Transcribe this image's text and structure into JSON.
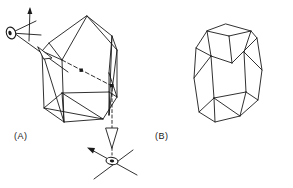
{
  "figure": {
    "background_color": "#ffffff",
    "line_color": "#1a1a1a",
    "panels": [
      {
        "id": "panel-a",
        "label": "(A)",
        "label_x": 14,
        "label_y": 131,
        "description": "Crystal prism with traced light ray and two viewing-direction eye symbols with crossed axes"
      },
      {
        "id": "panel-b",
        "label": "(B)",
        "label_x": 155,
        "label_y": 131,
        "description": "Bare polyhedral crystal outline, hexagonal prism with pyramidal terminations"
      }
    ],
    "panel_a": {
      "crystal_outline": [
        [
          87,
          16
        ],
        [
          112,
          36
        ],
        [
          115,
          43
        ],
        [
          117,
          97
        ],
        [
          103,
          119
        ],
        [
          64,
          122
        ],
        [
          44,
          108
        ],
        [
          42,
          51
        ],
        [
          49,
          43
        ],
        [
          87,
          16
        ]
      ],
      "crystal_edges": [
        {
          "name": "apex-to-left-front",
          "points": [
            [
              87,
              16
            ],
            [
              62,
              60
            ]
          ]
        },
        {
          "name": "apex-to-right-front",
          "points": [
            [
              87,
              16
            ],
            [
              112,
              36
            ]
          ]
        },
        {
          "name": "left-upper-face",
          "points": [
            [
              49,
              43
            ],
            [
              62,
              60
            ]
          ]
        },
        {
          "name": "right-upper-face",
          "points": [
            [
              112,
              36
            ],
            [
              109,
              73
            ]
          ]
        },
        {
          "name": "front-vertical",
          "points": [
            [
              62,
              60
            ],
            [
              64,
              122
            ]
          ]
        },
        {
          "name": "left-vertical",
          "points": [
            [
              42,
              51
            ],
            [
              44,
              108
            ]
          ]
        },
        {
          "name": "right-vertical",
          "points": [
            [
              109,
              73
            ],
            [
              109,
              115
            ]
          ]
        },
        {
          "name": "far-right-vertical",
          "points": [
            [
              117,
              50
            ],
            [
              117,
              97
            ]
          ]
        },
        {
          "name": "apex-right-edge",
          "points": [
            [
              87,
              16
            ],
            [
              117,
              50
            ]
          ]
        },
        {
          "name": "upper-right-seam",
          "points": [
            [
              112,
              36
            ],
            [
              117,
              50
            ]
          ]
        },
        {
          "name": "mid-seam-left",
          "points": [
            [
              42,
              51
            ],
            [
              62,
              60
            ]
          ]
        },
        {
          "name": "base-front-left",
          "points": [
            [
              64,
              122
            ],
            [
              44,
              108
            ]
          ]
        },
        {
          "name": "base-front-right",
          "points": [
            [
              64,
              122
            ],
            [
              103,
              119
            ]
          ]
        },
        {
          "name": "base-right-seam",
          "points": [
            [
              103,
              119
            ],
            [
              117,
              97
            ]
          ]
        },
        {
          "name": "base-inner-left",
          "points": [
            [
              44,
              108
            ],
            [
              62,
              93
            ]
          ]
        },
        {
          "name": "base-inner-diag",
          "points": [
            [
              62,
              93
            ],
            [
              109,
              92
            ]
          ]
        },
        {
          "name": "base-inner-right",
          "points": [
            [
              109,
              92
            ],
            [
              117,
              97
            ]
          ]
        },
        {
          "name": "base-inner-down",
          "points": [
            [
              62,
              93
            ],
            [
              64,
              122
            ]
          ]
        },
        {
          "name": "base-cross-diag",
          "points": [
            [
              44,
              108
            ],
            [
              103,
              119
            ]
          ]
        },
        {
          "name": "base-cross-diag-2",
          "points": [
            [
              62,
              93
            ],
            [
              103,
              119
            ]
          ]
        },
        {
          "name": "right-face-diag",
          "points": [
            [
              109,
              73
            ],
            [
              117,
              97
            ]
          ]
        },
        {
          "name": "right-face-diag-2",
          "points": [
            [
              112,
              36
            ],
            [
              109,
              115
            ]
          ]
        },
        {
          "name": "right-outer-edge",
          "points": [
            [
              117,
              50
            ],
            [
              109,
              115
            ]
          ]
        },
        {
          "name": "left-face-diag",
          "points": [
            [
              42,
              51
            ],
            [
              64,
              122
            ]
          ]
        }
      ],
      "incoming_ray": {
        "name": "incoming-light-ray",
        "points": [
          [
            14,
            33
          ],
          [
            68,
            72
          ]
        ],
        "style": "solid",
        "arrowhead_at": [
          44,
          53
        ],
        "arrowhead_type": "open-elongated"
      },
      "internal_ray": {
        "name": "internal-refracted-ray",
        "points": [
          [
            62,
            60
          ],
          [
            112,
            86
          ]
        ],
        "style": "dashed",
        "marker_points": [
          [
            82,
            71
          ],
          [
            112,
            86
          ]
        ]
      },
      "exit_ray": {
        "name": "exit-light-ray",
        "points": [
          [
            112,
            86
          ],
          [
            112,
            155
          ]
        ],
        "style": "dashed-to-solid",
        "arrowhead_at": [
          112,
          140
        ],
        "arrowhead_type": "open-elongated"
      },
      "eye_top": {
        "name": "observer-eye-top",
        "cx": 11,
        "cy": 33,
        "rx": 5,
        "ry": 6,
        "rotation": -15,
        "axes": [
          {
            "points": [
              [
                11,
                33
              ],
              [
                34,
                20
              ]
            ]
          },
          {
            "points": [
              [
                11,
                33
              ],
              [
                40,
                34
              ]
            ]
          },
          {
            "points": [
              [
                30,
                8
              ],
              [
                29,
                40
              ]
            ]
          }
        ],
        "axis_arrow_at": [
          30,
          9
        ]
      },
      "eye_bottom": {
        "name": "observer-eye-bottom",
        "cx": 112,
        "cy": 160,
        "rx": 6,
        "ry": 4,
        "rotation": 10,
        "axes": [
          {
            "points": [
              [
                88,
                148
              ],
              [
                136,
                174
              ]
            ]
          },
          {
            "points": [
              [
                93,
                178
              ],
              [
                132,
                150
              ]
            ]
          }
        ],
        "axis_arrow_at": [
          89,
          149
        ]
      }
    },
    "panel_b": {
      "crystal_outline": [
        [
          226,
          24
        ],
        [
          251,
          31
        ],
        [
          257,
          38
        ],
        [
          262,
          70
        ],
        [
          258,
          100
        ],
        [
          240,
          116
        ],
        [
          215,
          122
        ],
        [
          199,
          112
        ],
        [
          194,
          78
        ],
        [
          196,
          48
        ],
        [
          207,
          31
        ],
        [
          226,
          24
        ]
      ],
      "crystal_edges": [
        {
          "name": "top-facet-left",
          "points": [
            [
              207,
              31
            ],
            [
              226,
              24
            ]
          ]
        },
        {
          "name": "top-facet-right",
          "points": [
            [
              226,
              24
            ],
            [
              251,
              31
            ]
          ]
        },
        {
          "name": "top-facet-inner-left",
          "points": [
            [
              207,
              31
            ],
            [
              229,
              36
            ]
          ]
        },
        {
          "name": "top-facet-inner-right",
          "points": [
            [
              229,
              36
            ],
            [
              251,
              31
            ]
          ]
        },
        {
          "name": "upper-left-edge",
          "points": [
            [
              196,
              48
            ],
            [
              207,
              31
            ]
          ]
        },
        {
          "name": "upper-right-edge",
          "points": [
            [
              251,
              31
            ],
            [
              257,
              38
            ]
          ]
        },
        {
          "name": "mid-left-vertical",
          "points": [
            [
              196,
              48
            ],
            [
              199,
              112
            ]
          ]
        },
        {
          "name": "mid-right-vertical",
          "points": [
            [
              257,
              38
            ],
            [
              258,
              100
            ]
          ]
        },
        {
          "name": "far-left-vertical",
          "points": [
            [
              194,
              78
            ],
            [
              199,
              112
            ]
          ]
        },
        {
          "name": "far-right-vertical",
          "points": [
            [
              262,
              70
            ],
            [
              258,
              100
            ]
          ]
        },
        {
          "name": "inner-vertical-a",
          "points": [
            [
              229,
              36
            ],
            [
              232,
              63
            ]
          ]
        },
        {
          "name": "inner-vertical-b",
          "points": [
            [
              211,
              56
            ],
            [
              214,
              98
            ]
          ]
        },
        {
          "name": "inner-vertical-c",
          "points": [
            [
              244,
              52
            ],
            [
              246,
              92
            ]
          ]
        },
        {
          "name": "belt-upper",
          "points": [
            [
              196,
              48
            ],
            [
              211,
              56
            ]
          ]
        },
        {
          "name": "belt-upper-2",
          "points": [
            [
              211,
              56
            ],
            [
              232,
              63
            ]
          ]
        },
        {
          "name": "belt-upper-3",
          "points": [
            [
              232,
              63
            ],
            [
              257,
              38
            ]
          ]
        },
        {
          "name": "belt-lower",
          "points": [
            [
              199,
              112
            ],
            [
              214,
              98
            ]
          ]
        },
        {
          "name": "belt-lower-2",
          "points": [
            [
              214,
              98
            ],
            [
              246,
              92
            ]
          ]
        },
        {
          "name": "belt-lower-3",
          "points": [
            [
              246,
              92
            ],
            [
              258,
              100
            ]
          ]
        },
        {
          "name": "bottom-facet-left",
          "points": [
            [
              199,
              112
            ],
            [
              215,
              122
            ]
          ]
        },
        {
          "name": "bottom-facet-mid",
          "points": [
            [
              215,
              122
            ],
            [
              240,
              116
            ]
          ]
        },
        {
          "name": "bottom-facet-right",
          "points": [
            [
              240,
              116
            ],
            [
              258,
              100
            ]
          ]
        },
        {
          "name": "bottom-inner-1",
          "points": [
            [
              214,
              98
            ],
            [
              215,
              122
            ]
          ]
        },
        {
          "name": "bottom-inner-2",
          "points": [
            [
              214,
              98
            ],
            [
              240,
              116
            ]
          ]
        },
        {
          "name": "bottom-inner-3",
          "points": [
            [
              246,
              92
            ],
            [
              240,
              116
            ]
          ]
        },
        {
          "name": "left-face-diag",
          "points": [
            [
              194,
              78
            ],
            [
              211,
              56
            ]
          ]
        },
        {
          "name": "right-face-diag",
          "points": [
            [
              262,
              70
            ],
            [
              244,
              52
            ]
          ]
        },
        {
          "name": "right-face-diag-2",
          "points": [
            [
              257,
              38
            ],
            [
              262,
              70
            ]
          ]
        },
        {
          "name": "left-face-diag-2",
          "points": [
            [
              196,
              48
            ],
            [
              194,
              78
            ]
          ]
        }
      ]
    }
  }
}
